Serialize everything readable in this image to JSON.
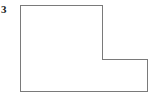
{
  "figure": {
    "label": "3",
    "shape_name": "l-shaped-polygon",
    "outline_color": "#7a7a7a",
    "fill_color": "#ffffff",
    "background_color": "#ffffff",
    "stroke_width": 1,
    "canvas": {
      "width": 163,
      "height": 100
    },
    "vertices": [
      {
        "x": 20,
        "y": 5
      },
      {
        "x": 102,
        "y": 5
      },
      {
        "x": 102,
        "y": 59
      },
      {
        "x": 147,
        "y": 59
      },
      {
        "x": 147,
        "y": 91
      },
      {
        "x": 20,
        "y": 91
      }
    ],
    "points_attr": "20,5 102,5 102,59 147,59 147,91 20,91"
  }
}
